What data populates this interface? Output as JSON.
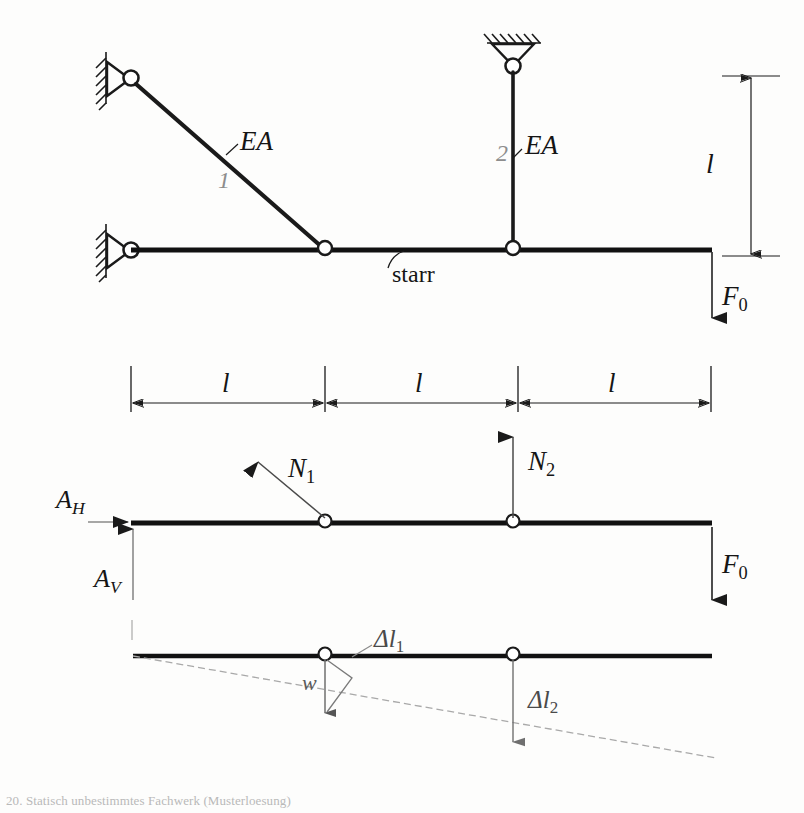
{
  "figure": {
    "domain_note": "engineering statics diagram",
    "caption": "20. Statisch unbestimmtes Fachwerk (Musterloesung)"
  },
  "colors": {
    "ink": "#151515",
    "gray": "#8d8d8d",
    "dashed": "#a9a9a9",
    "paper": "#fdfdfc"
  },
  "top_figure": {
    "name": "structure-diagram",
    "labels": {
      "bar1_stiffness": "EA",
      "bar1_number": "1",
      "bar2_stiffness": "EA",
      "bar2_number": "2",
      "rigid_bar": "starr",
      "height_dim": "l",
      "load": "F",
      "load_sub": "0"
    },
    "supports": [
      {
        "name": "pin-support-top-left",
        "type": "pinned-wall",
        "x": 130,
        "y": 78
      },
      {
        "name": "pin-support-bottom-left",
        "type": "pinned-wall",
        "x": 130,
        "y": 250
      },
      {
        "name": "pin-support-ceiling",
        "type": "pinned-ceiling",
        "x": 513,
        "y": 65
      }
    ],
    "joints": [
      {
        "name": "joint-bar1-beam",
        "x": 325,
        "y": 250
      },
      {
        "name": "joint-bar2-beam",
        "x": 513,
        "y": 250
      }
    ]
  },
  "dimension_row": {
    "name": "horizontal-dimensions",
    "segments": [
      {
        "label": "l",
        "from": 130,
        "to": 325
      },
      {
        "label": "l",
        "from": 325,
        "to": 518
      },
      {
        "label": "l",
        "from": 518,
        "to": 710
      }
    ]
  },
  "fbd_figure": {
    "name": "free-body-diagram",
    "labels": {
      "reaction_h": "A",
      "reaction_h_sub": "H",
      "reaction_v": "A",
      "reaction_v_sub": "V",
      "force_bar1": "N",
      "force_bar1_sub": "1",
      "force_bar2": "N",
      "force_bar2_sub": "2",
      "load": "F",
      "load_sub": "0"
    }
  },
  "displacement_figure": {
    "name": "displacement-diagram",
    "labels": {
      "rotation": "w",
      "elongation1": "Δl",
      "elongation1_sub": "1",
      "elongation2": "Δl",
      "elongation2_sub": "2"
    }
  }
}
